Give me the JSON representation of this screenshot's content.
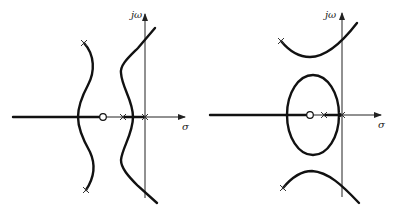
{
  "figure": {
    "type": "root-locus-pair",
    "panels": [
      {
        "id": "left",
        "axis_labels": {
          "imag": "jω",
          "real": "σ"
        },
        "zeros": [
          {
            "x": 103,
            "y": 117
          }
        ],
        "poles": [
          {
            "x": 84,
            "y": 43
          },
          {
            "x": 86,
            "y": 190
          },
          {
            "x": 123,
            "y": 117
          },
          {
            "x": 145,
            "y": 117
          }
        ]
      },
      {
        "id": "right",
        "axis_labels": {
          "imag": "jω",
          "real": "σ"
        },
        "zeros": [
          {
            "x": 310,
            "y": 115
          }
        ],
        "poles": [
          {
            "x": 281,
            "y": 41
          },
          {
            "x": 283,
            "y": 188
          },
          {
            "x": 324,
            "y": 115
          },
          {
            "x": 342,
            "y": 115
          }
        ]
      }
    ]
  }
}
